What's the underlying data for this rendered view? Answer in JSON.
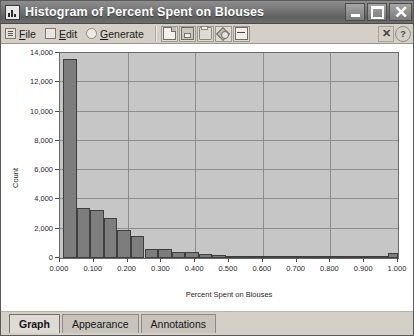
{
  "window": {
    "title": "Histogram of Percent Spent on Blouses",
    "app_icon": "histogram-icon",
    "minimize_label": "_",
    "maximize_label": "□",
    "close_label": "✕"
  },
  "toolbar": {
    "menus": [
      {
        "label": "File",
        "mnemonic": "F",
        "icon": "file-menu-icon"
      },
      {
        "label": "Edit",
        "mnemonic": "E",
        "icon": "edit-menu-icon"
      },
      {
        "label": "Generate",
        "mnemonic": "G",
        "icon": "generate-menu-icon"
      }
    ],
    "buttons": [
      {
        "name": "new-page-button",
        "icon": "page-icon"
      },
      {
        "name": "save-button",
        "icon": "disk-icon"
      },
      {
        "name": "print-button",
        "icon": "printer-icon"
      },
      {
        "name": "properties-button",
        "icon": "tag-icon"
      },
      {
        "name": "fit-width-button",
        "icon": "fit-width-icon"
      }
    ],
    "right_buttons": [
      {
        "name": "close-view-button",
        "icon": "close-x-icon",
        "label": "✕"
      },
      {
        "name": "help-button",
        "icon": "question-mark-icon",
        "label": "?"
      }
    ]
  },
  "chart_data": {
    "type": "bar",
    "title": "Histogram of Percent Spent on Blouses",
    "xlabel": "Percent Spent on Blouses",
    "ylabel": "Count",
    "xlim": [
      0.0,
      1.0
    ],
    "ylim": [
      0,
      14000
    ],
    "grid": true,
    "legend": null,
    "xticks": [
      "0.000",
      "0.100",
      "0.200",
      "0.300",
      "0.400",
      "0.500",
      "0.600",
      "0.700",
      "0.800",
      "0.900",
      "1.000"
    ],
    "xtick_values": [
      0.0,
      0.1,
      0.2,
      0.3,
      0.4,
      0.5,
      0.6,
      0.7,
      0.8,
      0.9,
      1.0
    ],
    "yticks": [
      "0",
      "2,000",
      "4,000",
      "6,000",
      "8,000",
      "10,000",
      "12,000",
      "14,000"
    ],
    "ytick_values": [
      0,
      2000,
      4000,
      6000,
      8000,
      10000,
      12000,
      14000
    ],
    "bin_width": 0.04,
    "bin_starts": [
      0.01,
      0.05,
      0.09,
      0.13,
      0.17,
      0.21,
      0.25,
      0.29,
      0.33,
      0.37,
      0.41,
      0.45,
      0.49,
      0.53,
      0.57,
      0.61,
      0.65,
      0.69,
      0.73,
      0.77,
      0.81,
      0.85,
      0.89,
      0.93,
      0.97
    ],
    "values": [
      13600,
      3400,
      3300,
      2700,
      1900,
      1500,
      600,
      600,
      420,
      400,
      260,
      220,
      170,
      150,
      110,
      95,
      80,
      70,
      55,
      45,
      35,
      30,
      25,
      20,
      320
    ]
  },
  "tabs": [
    {
      "label": "Graph",
      "active": true
    },
    {
      "label": "Appearance",
      "active": false
    },
    {
      "label": "Annotations",
      "active": false
    }
  ]
}
